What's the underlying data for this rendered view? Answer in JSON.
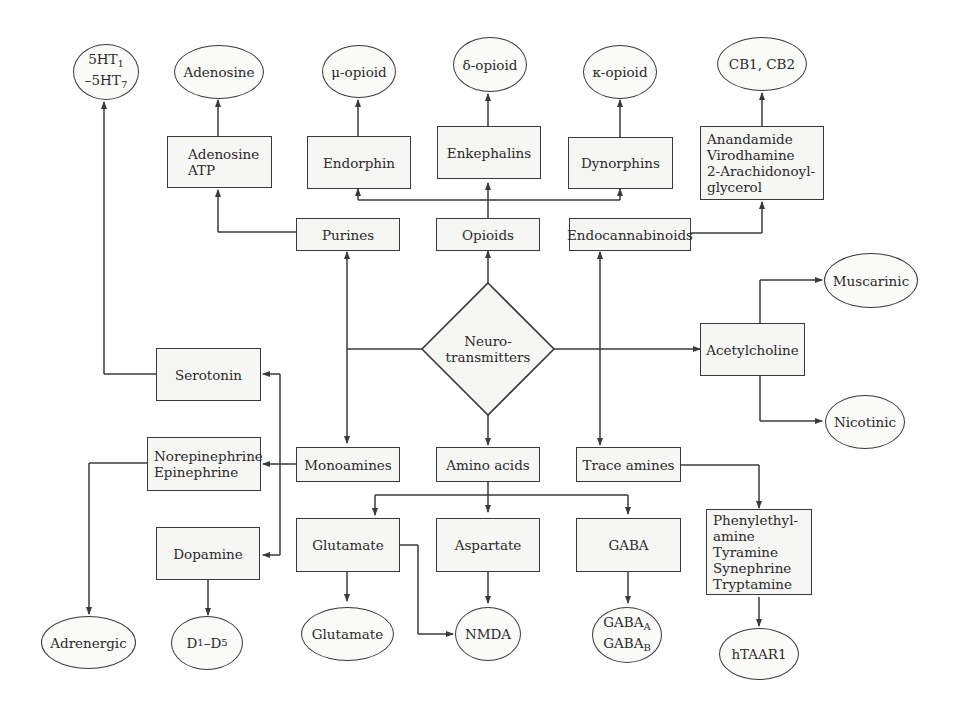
{
  "diagram": {
    "center": {
      "label": "Neuro-\ntransmitters"
    },
    "categories": {
      "purines": "Purines",
      "opioids": "Opioids",
      "endocannabinoids": "Endocannabinoids",
      "acetylcholine": "Acetylcholine",
      "monoamines": "Monoamines",
      "amino_acids": "Amino acids",
      "trace_amines": "Trace amines"
    },
    "transmitters": {
      "adenosine_atp": "Adenosine\nATP",
      "endorphin": "Endorphin",
      "enkephalins": "Enkephalins",
      "dynorphins": "Dynorphins",
      "endocannabinoid_list": "Anandamide\nVirodhamine\n2-Arachidonoyl-\nglycerol",
      "serotonin": "Serotonin",
      "norepinephrine": "Norepinephrine\nEpinephrine",
      "dopamine": "Dopamine",
      "glutamate": "Glutamate",
      "aspartate": "Aspartate",
      "gaba": "GABA",
      "trace_list": "Phenylethyl-\namine\nTyramine\nSynephrine\nTryptamine"
    },
    "receptors": {
      "serotonin_r_1": "5HT",
      "serotonin_r_1_sub": "1",
      "serotonin_r_2": "–5HT",
      "serotonin_r_2_sub": "7",
      "adenosine": "Adenosine",
      "mu": "μ-opioid",
      "delta": "δ-opioid",
      "kappa": "κ-opioid",
      "cb": "CB1, CB2",
      "muscarinic": "Muscarinic",
      "nicotinic": "Nicotinic",
      "adrenergic": "Adrenergic",
      "dopamine_r": "D",
      "dopamine_r_sub1": "1",
      "dopamine_r_mid": "–D",
      "dopamine_r_sub2": "5",
      "glutamate": "Glutamate",
      "nmda": "NMDA",
      "gaba_r": "GABA",
      "gaba_r_sub_a": "A",
      "gaba_r_sub_b": "B",
      "htaar1": "hTAAR1"
    },
    "colors": {
      "line": "#3a3a3a",
      "fill": "#f6f6f4"
    }
  }
}
